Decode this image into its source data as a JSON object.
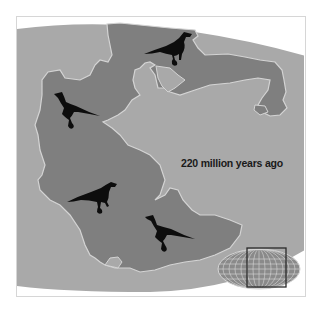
{
  "map": {
    "caption": "220 million years ago",
    "colors": {
      "ocean": "#a9a9a9",
      "land": "#7f7f7f",
      "coastline": "#d4d4d4",
      "dinosaur": "#0d0d0d",
      "background": "#ffffff",
      "inset_frame": "#2a2a2a"
    },
    "dinosaurs": [
      {
        "region": "north",
        "x": 168,
        "y": 47
      },
      {
        "region": "west",
        "x": 75,
        "y": 105
      },
      {
        "region": "south-west",
        "x": 100,
        "y": 200
      },
      {
        "region": "south-east",
        "x": 165,
        "y": 232
      }
    ],
    "inset": {
      "type": "world-globe-locator",
      "highlight": "Pangaea region"
    }
  }
}
